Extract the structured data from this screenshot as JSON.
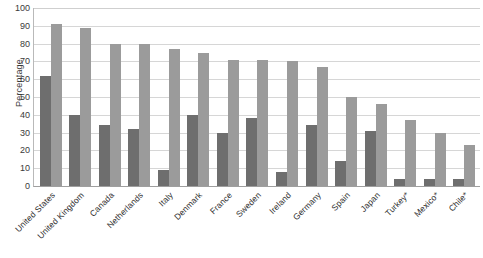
{
  "chart_data": {
    "type": "bar",
    "title": "",
    "subtitle": "",
    "xlabel": "",
    "ylabel": "Percentage",
    "ylim": [
      0,
      100
    ],
    "ytick_step": 10,
    "yticks": [
      100,
      90,
      80,
      70,
      60,
      50,
      40,
      30,
      20,
      10,
      0
    ],
    "grid": true,
    "legend": null,
    "legend_position": "none",
    "orientation": "vertical",
    "group_mode": "grouped",
    "categories": [
      "United States",
      "United Kingdom",
      "Canada",
      "Netherlands",
      "Italy",
      "Denmark",
      "France",
      "Sweden",
      "Ireland",
      "Germany",
      "Spain",
      "Japan",
      "Turkey*",
      "Mexico*",
      "Chile*"
    ],
    "series": [
      {
        "name": "series-1",
        "color": "#6e6e6e",
        "values": [
          62,
          40,
          34,
          32,
          9,
          40,
          30,
          38,
          8,
          34,
          14,
          31,
          4,
          4,
          4
        ]
      },
      {
        "name": "series-2",
        "color": "#9b9b9b",
        "values": [
          91,
          89,
          80,
          80,
          77,
          75,
          71,
          71,
          70,
          67,
          50,
          46,
          37,
          30,
          23
        ]
      }
    ],
    "annotations": [
      "* denotes country marked with asterisk"
    ]
  },
  "colors": {
    "series_dark": "#6e6e6e",
    "series_light": "#9b9b9b",
    "gridline": "#d6d6d6",
    "axis": "#9f9f9f",
    "text": "#2e2e2e",
    "background": "#ffffff"
  }
}
